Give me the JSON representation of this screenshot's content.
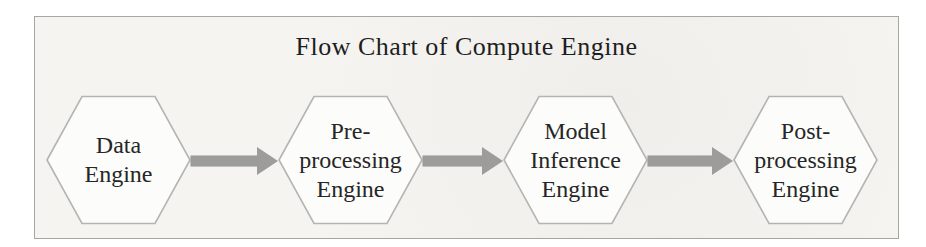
{
  "figure": {
    "title": "Flow Chart of Compute Engine",
    "type": "flowchart"
  },
  "nodes": [
    {
      "name": "Data Engine",
      "shape": "hexagon",
      "lines": [
        "Data",
        "Engine"
      ]
    },
    {
      "name": "Pre-processing Engine",
      "shape": "hexagon",
      "lines": [
        "Pre-",
        "processing",
        "Engine"
      ]
    },
    {
      "name": "Model Inference Engine",
      "shape": "hexagon",
      "lines": [
        "Model",
        "Inference",
        "Engine"
      ]
    },
    {
      "name": "Post-processing Engine",
      "shape": "hexagon",
      "lines": [
        "Post-",
        "processing",
        "Engine"
      ]
    }
  ],
  "connectors": [
    {
      "from": "Data Engine",
      "to": "Pre-processing Engine",
      "icon": "arrow-right-icon"
    },
    {
      "from": "Pre-processing Engine",
      "to": "Model Inference Engine",
      "icon": "arrow-right-icon"
    },
    {
      "from": "Model Inference Engine",
      "to": "Post-processing Engine",
      "icon": "arrow-right-icon"
    }
  ],
  "colors": {
    "frame_background": "#f5f4f1",
    "frame_border": "#a7a7a1",
    "hexagon_fill": "#fcfcfb",
    "hexagon_border": "#b4b4b0",
    "arrow": "#9c9c9a",
    "text": "#262626"
  }
}
